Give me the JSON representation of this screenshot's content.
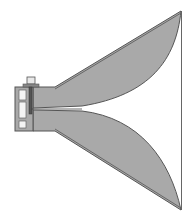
{
  "diagram": {
    "colors": {
      "background": "#ffffff",
      "fill": "#a9a9a9",
      "stroke": "#555555",
      "connector": "#e8e8e8"
    },
    "parts": [
      {
        "name": "coaxial-connector"
      },
      {
        "name": "feed-cavity"
      },
      {
        "name": "upper-ridge"
      },
      {
        "name": "lower-ridge"
      },
      {
        "name": "horn-aperture"
      }
    ]
  }
}
